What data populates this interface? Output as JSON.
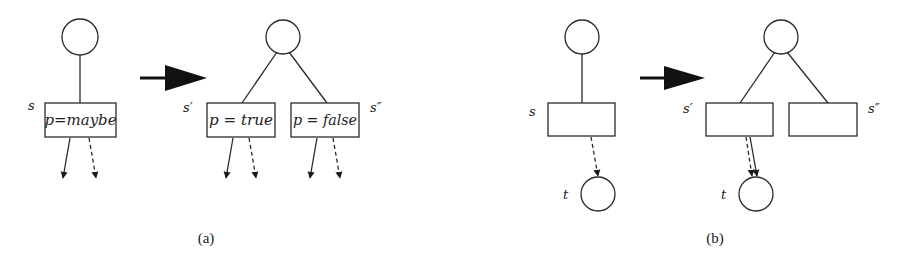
{
  "panels": [
    {
      "id": "a",
      "caption": "(a)",
      "before": {
        "state_label": "s",
        "box_text": "p=maybe"
      },
      "after": {
        "left_label": "s′",
        "right_label": "s″",
        "left_box_text": "p = true",
        "right_box_text": "p = false"
      }
    },
    {
      "id": "b",
      "caption": "(b)",
      "before": {
        "state_label": "s",
        "target_label": "t"
      },
      "after": {
        "left_label": "s′",
        "right_label": "s″",
        "target_label": "t"
      }
    }
  ],
  "icons": {
    "transform_arrow": "right-arrow-icon",
    "solid_edge": "solid-arrow",
    "dashed_edge": "dashed-arrow"
  },
  "colors": {
    "stroke": "#2a2a2a",
    "background": "#ffffff"
  }
}
